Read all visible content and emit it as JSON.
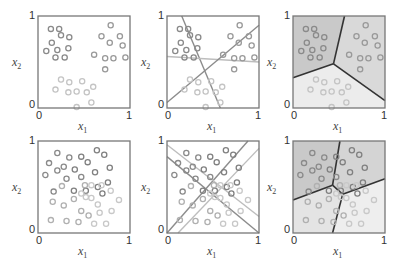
{
  "figure": {
    "colors": {
      "frame": "#777777",
      "class_dark": "#8a8a8a",
      "class_mid": "#9a9a9a",
      "class_light": "#c4c4c4",
      "line_gray": "#8c8c8c",
      "line_light": "#bdbdbd",
      "boundary_dark": "#333333",
      "region_dark": "#c9c9c9",
      "region_mid": "#d9d9d9",
      "region_light": "#ececec"
    },
    "axes": {
      "xlabel": "x",
      "xlabel_sub": "1",
      "ylabel": "x",
      "ylabel_sub": "2",
      "x_ticks": [
        "0",
        "1"
      ],
      "y_ticks": [
        "0",
        "1"
      ]
    },
    "panels": [
      {
        "id": "top-left",
        "title": "three-class data",
        "row": 0,
        "col": 0
      },
      {
        "id": "top-middle",
        "title": "pairwise linear discriminants",
        "row": 0,
        "col": 1
      },
      {
        "id": "top-right",
        "title": "decision regions",
        "row": 0,
        "col": 2
      },
      {
        "id": "bottom-left",
        "title": "four-class data",
        "row": 1,
        "col": 0
      },
      {
        "id": "bottom-middle",
        "title": "pairwise linear discriminants",
        "row": 1,
        "col": 1
      },
      {
        "id": "bottom-right",
        "title": "decision regions",
        "row": 1,
        "col": 2
      }
    ]
  },
  "chart_data": [
    {
      "type": "scatter",
      "title": "Three-class data",
      "xlabel": "x1",
      "ylabel": "x2",
      "xlim": [
        0,
        1
      ],
      "ylim": [
        0,
        1
      ],
      "series": [
        {
          "name": "class A (upper-left)",
          "color": "#8a8a8a",
          "points": [
            [
              0.14,
              0.86
            ],
            [
              0.23,
              0.86
            ],
            [
              0.25,
              0.79
            ],
            [
              0.34,
              0.77
            ],
            [
              0.15,
              0.71
            ],
            [
              0.33,
              0.65
            ],
            [
              0.09,
              0.62
            ],
            [
              0.21,
              0.63
            ],
            [
              0.19,
              0.55
            ],
            [
              0.29,
              0.55
            ]
          ]
        },
        {
          "name": "class B (upper-right)",
          "color": "#999999",
          "points": [
            [
              0.79,
              0.9
            ],
            [
              0.69,
              0.78
            ],
            [
              0.89,
              0.78
            ],
            [
              0.78,
              0.71
            ],
            [
              0.92,
              0.68
            ],
            [
              0.61,
              0.58
            ],
            [
              0.73,
              0.54
            ],
            [
              0.82,
              0.54
            ],
            [
              0.95,
              0.55
            ],
            [
              0.73,
              0.42
            ]
          ]
        },
        {
          "name": "class C (bottom)",
          "color": "#c4c4c4",
          "points": [
            [
              0.25,
              0.31
            ],
            [
              0.34,
              0.28
            ],
            [
              0.48,
              0.29
            ],
            [
              0.19,
              0.2
            ],
            [
              0.33,
              0.17
            ],
            [
              0.42,
              0.18
            ],
            [
              0.53,
              0.17
            ],
            [
              0.6,
              0.23
            ],
            [
              0.58,
              0.06
            ],
            [
              0.42,
              0.01
            ]
          ]
        }
      ]
    },
    {
      "type": "scatter",
      "title": "Three-class data with pairwise linear boundaries",
      "xlabel": "x1",
      "ylabel": "x2",
      "xlim": [
        0,
        1
      ],
      "ylim": [
        0,
        1
      ],
      "lines": [
        {
          "name": "boundary A/C vs B (steep)",
          "from": [
            0.16,
            1.0
          ],
          "to": [
            0.58,
            0.0
          ]
        },
        {
          "name": "boundary horizontal",
          "from": [
            0.0,
            0.56
          ],
          "to": [
            1.0,
            0.5
          ]
        },
        {
          "name": "boundary diagonal",
          "from": [
            0.0,
            0.06
          ],
          "to": [
            1.0,
            0.9
          ]
        }
      ],
      "series_ref": "same points as panel 1"
    },
    {
      "type": "scatter",
      "title": "Three-class decision regions",
      "xlabel": "x1",
      "ylabel": "x2",
      "xlim": [
        0,
        1
      ],
      "ylim": [
        0,
        1
      ],
      "regions": [
        {
          "name": "class A region",
          "shade": "#c9c9c9"
        },
        {
          "name": "class B region",
          "shade": "#d9d9d9"
        },
        {
          "name": "class C region",
          "shade": "#ececec"
        }
      ],
      "boundary_junction": [
        0.44,
        0.48
      ],
      "boundaries": [
        [
          [
            0.44,
            0.48
          ],
          [
            0.56,
            1.0
          ]
        ],
        [
          [
            0.44,
            0.48
          ],
          [
            0.0,
            0.33
          ]
        ],
        [
          [
            0.44,
            0.48
          ],
          [
            1.0,
            0.08
          ]
        ]
      ],
      "series_ref": "same points as panel 1"
    },
    {
      "type": "scatter",
      "title": "Four-class data",
      "xlabel": "x1",
      "ylabel": "x2",
      "xlim": [
        0,
        1
      ],
      "ylim": [
        0,
        1
      ],
      "series": [
        {
          "name": "class A (upper-left, dark)",
          "color": "#8a8a8a",
          "points": [
            [
              0.21,
              0.87
            ],
            [
              0.12,
              0.76
            ],
            [
              0.21,
              0.68
            ],
            [
              0.08,
              0.63
            ],
            [
              0.31,
              0.59
            ],
            [
              0.17,
              0.45
            ],
            [
              0.34,
              0.82
            ],
            [
              0.47,
              0.61
            ],
            [
              0.28,
              0.72
            ]
          ]
        },
        {
          "name": "class B (upper-right, dark)",
          "color": "#808080",
          "points": [
            [
              0.64,
              0.9
            ],
            [
              0.72,
              0.85
            ],
            [
              0.47,
              0.83
            ],
            [
              0.54,
              0.77
            ],
            [
              0.78,
              0.71
            ],
            [
              0.62,
              0.66
            ],
            [
              0.4,
              0.69
            ],
            [
              0.76,
              0.55
            ],
            [
              0.65,
              0.5
            ],
            [
              0.7,
              0.43
            ],
            [
              0.39,
              0.46
            ],
            [
              0.52,
              0.46
            ]
          ]
        },
        {
          "name": "class C (lower-left, light)",
          "color": "#b0b0b0",
          "points": [
            [
              0.26,
              0.51
            ],
            [
              0.16,
              0.34
            ],
            [
              0.28,
              0.3
            ],
            [
              0.39,
              0.37
            ],
            [
              0.14,
              0.14
            ],
            [
              0.31,
              0.13
            ],
            [
              0.47,
              0.24
            ],
            [
              0.44,
              0.12
            ],
            [
              0.55,
              0.19
            ],
            [
              0.51,
              0.52
            ]
          ]
        },
        {
          "name": "class D (lower-right, light)",
          "color": "#c8c8c8",
          "points": [
            [
              0.58,
              0.52
            ],
            [
              0.79,
              0.46
            ],
            [
              0.69,
              0.52
            ],
            [
              0.52,
              0.39
            ],
            [
              0.58,
              0.38
            ],
            [
              0.65,
              0.31
            ],
            [
              0.88,
              0.36
            ],
            [
              0.67,
              0.22
            ],
            [
              0.8,
              0.24
            ],
            [
              0.61,
              0.1
            ],
            [
              0.74,
              0.1
            ],
            [
              0.47,
              0.43
            ]
          ]
        }
      ]
    },
    {
      "type": "scatter",
      "title": "Four-class data with pairwise linear boundaries",
      "xlabel": "x1",
      "ylabel": "x2",
      "xlim": [
        0,
        1
      ],
      "ylim": [
        0,
        1
      ],
      "lines": [
        {
          "name": "dark diagonal up",
          "from": [
            0.0,
            0.0
          ],
          "to": [
            0.88,
            1.0
          ]
        },
        {
          "name": "dark diagonal down",
          "from": [
            0.0,
            0.83
          ],
          "to": [
            1.0,
            0.0
          ]
        },
        {
          "name": "light diagonal up",
          "from": [
            0.12,
            0.0
          ],
          "to": [
            1.0,
            0.92
          ]
        },
        {
          "name": "light diagonal down",
          "from": [
            0.0,
            0.96
          ],
          "to": [
            1.0,
            0.18
          ]
        }
      ],
      "series_ref": "same points as panel 4"
    },
    {
      "type": "scatter",
      "title": "Four-class decision regions",
      "xlabel": "x1",
      "ylabel": "x2",
      "xlim": [
        0,
        1
      ],
      "ylim": [
        0,
        1
      ],
      "regions": [
        {
          "name": "class A region (top-left)",
          "shade": "#c9c9c9"
        },
        {
          "name": "class B region (top-right)",
          "shade": "#d4d4d4"
        },
        {
          "name": "class C region (bottom-left)",
          "shade": "#e4e4e4"
        },
        {
          "name": "class D region (bottom-right)",
          "shade": "#eeeeee"
        }
      ],
      "boundaries": [
        [
          [
            0.51,
            1.0
          ],
          [
            0.43,
            0.52
          ]
        ],
        [
          [
            0.43,
            0.52
          ],
          [
            0.0,
            0.36
          ]
        ],
        [
          [
            0.43,
            0.52
          ],
          [
            0.54,
            0.42
          ]
        ],
        [
          [
            0.54,
            0.42
          ],
          [
            1.0,
            0.59
          ]
        ],
        [
          [
            0.54,
            0.42
          ],
          [
            0.43,
            0.0
          ]
        ]
      ],
      "series_ref": "same points as panel 4"
    }
  ]
}
